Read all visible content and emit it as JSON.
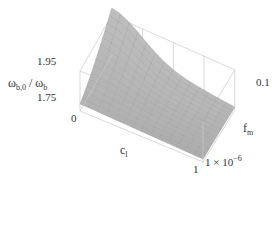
{
  "chart_data": {
    "type": "surface3d",
    "title": "",
    "zlabel_main": "ω",
    "zlabel_num_sub": "b,0",
    "zlabel_den_sub": "b",
    "zlabel_sep": " / ",
    "xlabel_main": "c",
    "xlabel_sub": "l",
    "ylabel_main": "f",
    "ylabel_sub": "m",
    "z_ticks": [
      "1.95",
      "1.75"
    ],
    "x_ticks": [
      "0",
      "1"
    ],
    "y_ticks_top": "0.1",
    "y_tick_low_base": "1 × 10",
    "y_tick_low_exp": "−6",
    "x_range": [
      0,
      1
    ],
    "y_range": [
      1e-06,
      0.1
    ],
    "z_range": [
      1.7,
      1.98
    ],
    "grid": false,
    "surface": {
      "description": "Peak near c_l=0 at f_m=0.1 (~1.98); decreases with c_l toward ~1.75 plateau; nearly flat near f_m=1e-6",
      "x_samples": [
        0,
        0.1,
        0.2,
        0.3,
        0.4,
        0.5,
        0.6,
        0.7,
        0.8,
        0.9,
        1.0
      ],
      "y_samples_fraction": [
        0,
        0.1,
        0.2,
        0.3,
        0.4,
        0.5,
        0.6,
        0.7,
        0.8,
        0.9,
        1.0
      ],
      "peak_z": 1.98,
      "base_z": 1.75
    }
  }
}
